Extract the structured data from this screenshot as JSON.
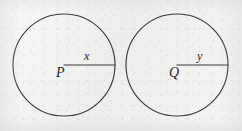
{
  "figure": {
    "type": "geometry-diagram",
    "ink_color": "#3a3a3e",
    "paper_color": "#f3f3f1",
    "label_color": "#26262a"
  },
  "circles": [
    {
      "id": "circle-p",
      "center_label": "P",
      "radius_label": "x",
      "center": {
        "x": 64,
        "y": 65
      },
      "radius": 51,
      "radius_endpoint": {
        "x": 115,
        "y": 65
      }
    },
    {
      "id": "circle-q",
      "center_label": "Q",
      "radius_label": "y",
      "center": {
        "x": 177,
        "y": 65
      },
      "radius": 51,
      "radius_endpoint": {
        "x": 228,
        "y": 65
      }
    }
  ],
  "labels": {
    "center_p": "P",
    "radius_x": "x",
    "center_q": "Q",
    "radius_y": "y"
  }
}
